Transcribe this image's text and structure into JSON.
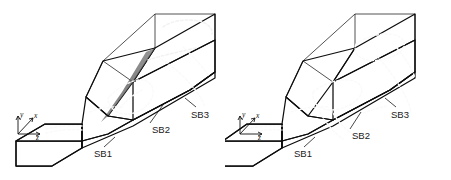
{
  "figure": {
    "type": "block-diagram-pair",
    "background": "#ffffff",
    "panels": [
      {
        "id": "left",
        "name": "left-block-diagram",
        "axes": {
          "x": "x",
          "y": "y",
          "z": "z"
        },
        "labels": [
          {
            "text": "SB1",
            "name": "label-sb1"
          },
          {
            "text": "SB2",
            "name": "label-sb2"
          },
          {
            "text": "SB3",
            "name": "label-sb3"
          }
        ]
      },
      {
        "id": "right",
        "name": "right-block-diagram",
        "axes": {
          "x": "x",
          "y": "y",
          "z": "z"
        },
        "labels": [
          {
            "text": "SB1",
            "name": "label-sb1"
          },
          {
            "text": "SB2",
            "name": "label-sb2"
          },
          {
            "text": "SB3",
            "name": "label-sb3"
          }
        ]
      }
    ]
  },
  "colors": {
    "background": "#ffffff",
    "face_top_dark": "#6a6a6a",
    "face_side_mid": "#7c7c7c",
    "face_slope_light": "#9a9a9a",
    "face_slope_lighter": "#a8a8a8",
    "face_front_dark": "#565656",
    "face_slab_top": "#5e5e5e",
    "face_slab_side": "#727272",
    "edge_stroke": "#0d0d0d",
    "wireframe_stroke": "#1a1a1a",
    "dashed_curve": "#f2f2f2",
    "label_text": "#1a1a1a"
  }
}
